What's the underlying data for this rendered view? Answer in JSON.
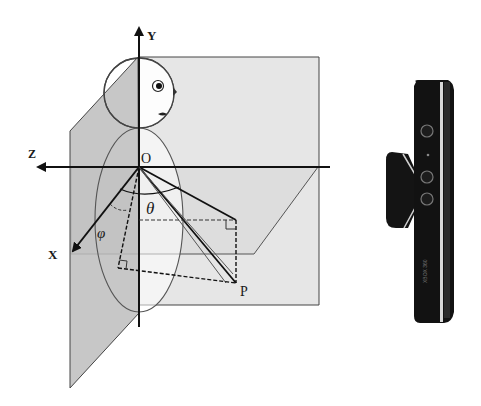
{
  "diagram": {
    "axes": {
      "y_label": "Y",
      "z_label": "Z",
      "x_label": "X",
      "origin_label": "O"
    },
    "point_label": "P",
    "angles": {
      "theta": "θ",
      "phi": "φ"
    },
    "device": {
      "name": "Kinect sensor",
      "side_text": "XBOX 360"
    },
    "colors": {
      "plane_light": "#e4e4e4",
      "plane_dark": "#c4c4c4",
      "line": "#222222",
      "thin_line": "#555555",
      "device_body": "#111111",
      "device_highlight": "#d8d8d8"
    }
  }
}
